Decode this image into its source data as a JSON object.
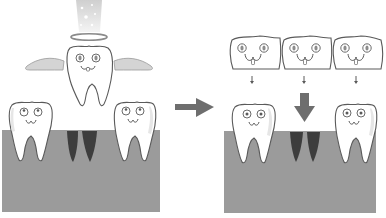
{
  "diagram": {
    "title": "",
    "colors": {
      "background": "#ffffff",
      "gum": "#9b9b9b",
      "gum_top": "#8e8e8e",
      "tooth_fill": "#ffffff",
      "tooth_outline": "#5a5a5a",
      "tooth_shade": "#e6e6e6",
      "socket": "#3d3d3d",
      "socket_light": "#5a5a5a",
      "arrow": "#6e6e6e",
      "wing": "#d4d4d4",
      "halo": "#8a8a8a",
      "light_beam": "#d8d8d8",
      "eye_iris": "#8c8c8c"
    },
    "panels": [
      {
        "name": "before",
        "elements": [
          "light-beam",
          "halo",
          "angel-tooth-with-wings",
          "tooth-left",
          "empty-socket",
          "tooth-right",
          "gum"
        ]
      },
      {
        "name": "after",
        "elements": [
          "bridge-crown-left",
          "bridge-crown-middle",
          "bridge-crown-right",
          "small-down-arrows",
          "big-down-arrow",
          "tooth-left",
          "empty-socket",
          "tooth-right",
          "gum"
        ]
      }
    ],
    "transition_arrow": "right-arrow"
  }
}
